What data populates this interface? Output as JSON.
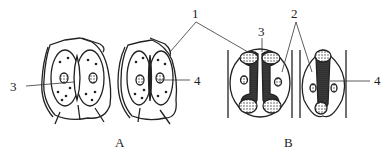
{
  "figure": {
    "panels": [
      {
        "id": "A",
        "label": "A",
        "description": "Guard cells with epidermal cells (surface view), two stomata"
      },
      {
        "id": "B",
        "label": "B",
        "description": "Dumbbell-shaped guard cells (grass type), two stomata"
      }
    ],
    "callouts": [
      {
        "number": "1",
        "label": "1"
      },
      {
        "number": "2",
        "label": "2"
      },
      {
        "number": "3",
        "label": "3"
      },
      {
        "number": "3",
        "label": "3"
      },
      {
        "number": "4",
        "label": "4"
      },
      {
        "number": "4",
        "label": "4"
      }
    ],
    "colors": {
      "ink": "#222222",
      "background": "#ffffff",
      "stipple": "#555555"
    }
  }
}
